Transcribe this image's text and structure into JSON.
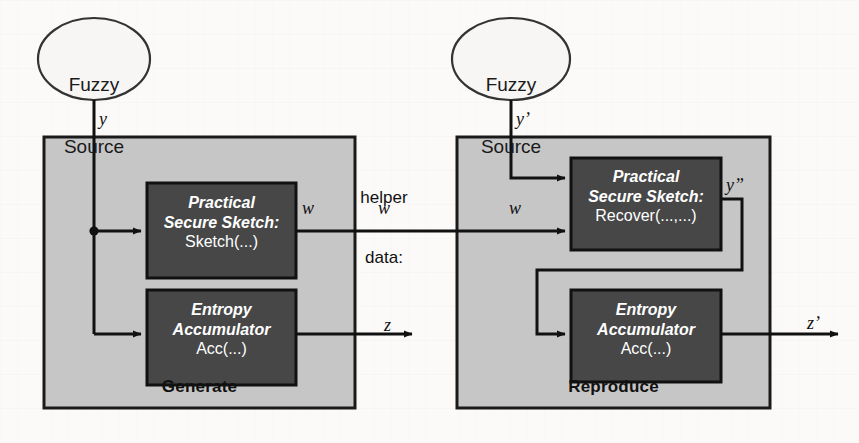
{
  "figure": {
    "type": "block-diagram",
    "background_color": "#fbfaf8",
    "panel_fill": "#c6c6c6",
    "panel_stroke": "#1a1a1a",
    "block_fill": "#474747",
    "block_text_color": "#ffffff",
    "line_color": "#111111"
  },
  "sources": [
    {
      "id": "source-left",
      "line1": "Fuzzy",
      "line2": "Source",
      "output_signal": "y"
    },
    {
      "id": "source-right",
      "line1": "Fuzzy",
      "line2": "Source",
      "output_signal": "y’"
    }
  ],
  "panels": [
    {
      "id": "generate",
      "title": "Generate",
      "blocks": [
        {
          "id": "generate-secure-sketch",
          "italic_line1": "Practical",
          "italic_line2": "Secure Sketch:",
          "roman_line": "Sketch(...)",
          "inputs": [
            "y"
          ],
          "outputs": [
            "w"
          ]
        },
        {
          "id": "generate-entropy-accumulator",
          "italic_line1": "Entropy",
          "italic_line2": "Accumulator",
          "roman_line": "Acc(...)",
          "inputs": [
            "y"
          ],
          "outputs": [
            "z"
          ]
        }
      ]
    },
    {
      "id": "reproduce",
      "title": "Reproduce",
      "blocks": [
        {
          "id": "reproduce-secure-sketch",
          "italic_line1": "Practical",
          "italic_line2": "Secure Sketch:",
          "roman_line": "Recover(...,...)",
          "inputs": [
            "y’",
            "w"
          ],
          "outputs": [
            "y”"
          ]
        },
        {
          "id": "reproduce-entropy-accumulator",
          "italic_line1": "Entropy",
          "italic_line2": "Accumulator",
          "roman_line": "Acc(...)",
          "inputs": [
            "y”"
          ],
          "outputs": [
            "z’"
          ]
        }
      ]
    }
  ],
  "channel": {
    "label_line1": "helper",
    "label_line2": "data:",
    "label_signal": "w"
  },
  "signals": {
    "y": "y",
    "y_prime": "y’",
    "y_double_prime": "y”",
    "w_generate_out": "w",
    "w_channel": "w",
    "w_reproduce_in": "w",
    "z": "z",
    "z_prime": "z’"
  }
}
